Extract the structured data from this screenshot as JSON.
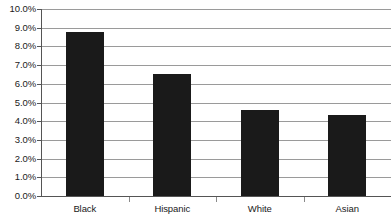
{
  "chart_data": {
    "type": "bar",
    "title": "",
    "subtitle": "",
    "xlabel": "",
    "ylabel": "",
    "categories": [
      "Black",
      "Hispanic",
      "White",
      "Asian"
    ],
    "values": [
      8.75,
      6.5,
      4.6,
      4.35
    ],
    "ylim": [
      0,
      10
    ],
    "ytick_values": [
      0,
      1,
      2,
      3,
      4,
      5,
      6,
      7,
      8,
      9,
      10
    ],
    "ytick_labels": [
      "0.0%",
      "1.0%",
      "2.0%",
      "3.0%",
      "4.0%",
      "5.0%",
      "6.0%",
      "7.0%",
      "8.0%",
      "9.0%",
      "10.0%"
    ],
    "grid": true,
    "legend": null,
    "legend_position": "none",
    "series": [
      {
        "name": "",
        "values": [
          8.75,
          6.5,
          4.6,
          4.35
        ]
      }
    ],
    "colors": {
      "bar": "#1a1a1a",
      "gridline": "#9a9a9a",
      "axis": "#555555",
      "text": "#1a1a1a",
      "background": "#ffffff"
    }
  }
}
